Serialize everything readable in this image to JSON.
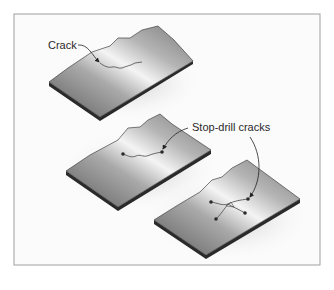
{
  "figure": {
    "panels": [
      {
        "id": "plate-cracked",
        "callout": "Crack",
        "state": "crack"
      },
      {
        "id": "plate-stop-drilled",
        "callout": "Stop-drill cracks",
        "state": "single crack drilled at both ends"
      },
      {
        "id": "plate-branched",
        "callout": "",
        "state": "branched crack drilled at each end"
      }
    ],
    "labels": {
      "crack": "Crack",
      "stop_drill": "Stop-drill cracks"
    },
    "colors": {
      "frame": "#9a9a9a",
      "plate_dark": "#6e6e6e",
      "plate_light": "#f2f2f2",
      "plate_edge": "#222222",
      "crack_line": "#444444",
      "drill_hole": "#2a2a2a"
    }
  }
}
